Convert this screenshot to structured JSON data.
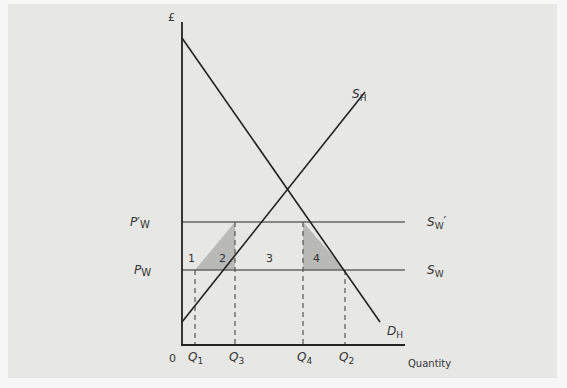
{
  "diagram": {
    "title": "",
    "colors": {
      "background": "#e7e7e6",
      "outer": "#f7f7f7",
      "line": "#222222",
      "price_line": "#666666",
      "shade": "#b9b9b8",
      "text": "#333333"
    },
    "axes": {
      "y_label": "£",
      "x_label": "Quantity",
      "origin_label": "0"
    },
    "curves": {
      "supply_home": {
        "label_main": "S",
        "label_sub": "H"
      },
      "demand_home": {
        "label_main": "D",
        "label_sub": "H"
      },
      "world_supply": {
        "label_main": "S",
        "label_sub": "W"
      },
      "world_supply_tariff": {
        "label_main": "S",
        "label_sub": "W",
        "label_prime": "′"
      }
    },
    "prices": {
      "world_price": {
        "label_main": "P",
        "label_sub": "W"
      },
      "world_price_tariff": {
        "label_main": "P",
        "label_prime": "′",
        "label_sub": "W"
      }
    },
    "quantities": [
      {
        "label_main": "Q",
        "label_sub": "1"
      },
      {
        "label_main": "Q",
        "label_sub": "3"
      },
      {
        "label_main": "Q",
        "label_sub": "4"
      },
      {
        "label_main": "Q",
        "label_sub": "2"
      }
    ],
    "areas": [
      {
        "label": "1",
        "shaded": false
      },
      {
        "label": "2",
        "shaded": true
      },
      {
        "label": "3",
        "shaded": false
      },
      {
        "label": "4",
        "shaded": true
      }
    ]
  }
}
